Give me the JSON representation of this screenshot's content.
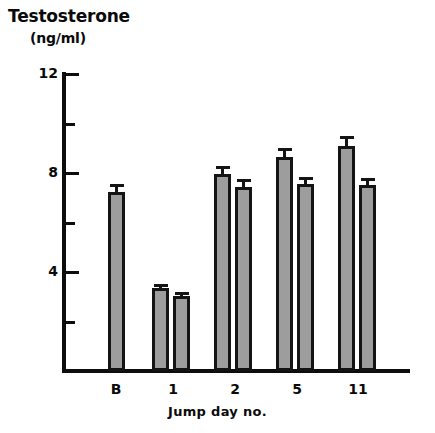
{
  "chart_data": {
    "type": "bar",
    "title": "Testosterone",
    "subtitle": "(ng/ml)",
    "ylabel": "Testosterone (ng/ml)",
    "xlabel": "Jump day no.",
    "categories": [
      "B",
      "1",
      "2",
      "5",
      "11"
    ],
    "ylim": [
      0,
      12
    ],
    "yticks_major": [
      4,
      8,
      12
    ],
    "yticks_minor": [
      2,
      6,
      10
    ],
    "ytick_labels": [
      "4",
      "8",
      "12"
    ],
    "grid": false,
    "legend": "none",
    "bar_color": "#9d9d9d",
    "edge_color": "#141414",
    "error_bars": "SEM, upper only",
    "series": [
      {
        "name": "bar 1",
        "values": [
          7.25,
          3.35,
          7.95,
          8.65,
          9.1
        ],
        "errors": [
          0.3,
          0.15,
          0.35,
          0.35,
          0.4
        ]
      },
      {
        "name": "bar 2",
        "values": [
          null,
          3.05,
          7.45,
          7.55,
          7.5
        ],
        "errors": [
          null,
          0.15,
          0.3,
          0.3,
          0.3
        ]
      }
    ],
    "bars": [
      {
        "group": "B",
        "index": 0,
        "value": 7.25,
        "error": 0.3,
        "x": 108,
        "width": 17
      },
      {
        "group": "1",
        "index": 0,
        "value": 3.35,
        "error": 0.15,
        "x": 152,
        "width": 17
      },
      {
        "group": "1",
        "index": 1,
        "value": 3.05,
        "error": 0.15,
        "x": 173,
        "width": 17
      },
      {
        "group": "2",
        "index": 0,
        "value": 7.95,
        "error": 0.35,
        "x": 214,
        "width": 17
      },
      {
        "group": "2",
        "index": 1,
        "value": 7.45,
        "error": 0.3,
        "x": 235,
        "width": 17
      },
      {
        "group": "5",
        "index": 0,
        "value": 8.65,
        "error": 0.35,
        "x": 276,
        "width": 17
      },
      {
        "group": "5",
        "index": 1,
        "value": 7.55,
        "error": 0.3,
        "x": 297,
        "width": 17
      },
      {
        "group": "11",
        "index": 0,
        "value": 9.1,
        "error": 0.4,
        "x": 338,
        "width": 17
      },
      {
        "group": "11",
        "index": 1,
        "value": 7.5,
        "error": 0.3,
        "x": 359,
        "width": 17
      }
    ],
    "group_label_x": [
      116,
      173,
      235,
      297,
      358
    ]
  },
  "axes": {
    "y_label_12": "12",
    "y_label_8": "8",
    "y_label_4": "4",
    "x_label_b": "B",
    "x_label_1": "1",
    "x_label_2": "2",
    "x_label_5": "5",
    "x_label_11": "11",
    "x_title": "Jump day no."
  },
  "header": {
    "title": "Testosterone",
    "units": "(ng/ml)"
  }
}
